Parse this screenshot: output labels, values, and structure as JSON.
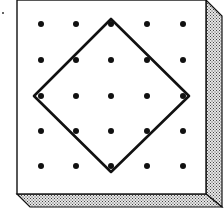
{
  "diagram": {
    "type": "geoboard",
    "grid": {
      "rows": 5,
      "cols": 5
    },
    "dot_x": [
      41,
      76,
      111,
      147,
      183
    ],
    "dot_y": [
      24,
      60,
      96,
      131,
      166
    ],
    "shape": {
      "name": "tilted-square",
      "vertices": [
        [
          111,
          19
        ],
        [
          189,
          96
        ],
        [
          111,
          172
        ],
        [
          34,
          96
        ]
      ]
    },
    "colors": {
      "board_face": "#ffffff",
      "outline": "#111111",
      "dot": "#111111",
      "edge_fill": "#d8d8d8",
      "edge_stipple": "#555555"
    }
  }
}
